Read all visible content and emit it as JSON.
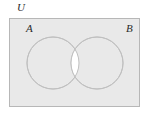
{
  "figure": {
    "name": "venn-diagram-two-sets-symmetric-difference",
    "type": "venn",
    "canvas": {
      "width": 150,
      "height": 118,
      "background": "#ffffff"
    },
    "universe": {
      "label": "U",
      "shape": "rectangle",
      "x": 9,
      "y": 18,
      "width": 131,
      "height": 89,
      "fill": "#e9e9e9",
      "stroke": "#b7b7b7",
      "stroke_width": 1
    },
    "sets": [
      {
        "id": "A",
        "label": "A",
        "cx": 53,
        "cy": 63,
        "r": 26,
        "fill": "#e9e9e9",
        "stroke": "#c0c0c0",
        "stroke_width": 1,
        "label_x": 26,
        "label_y": 23
      },
      {
        "id": "B",
        "label": "B",
        "cx": 97,
        "cy": 63,
        "r": 26,
        "fill": "#e9e9e9",
        "stroke": "#c0c0c0",
        "stroke_width": 1,
        "label_x": 126,
        "label_y": 23
      }
    ],
    "intersection": {
      "name": "A-intersect-B",
      "fill": "#ffffff",
      "stroke": "#c0c0c0",
      "shaded": false
    },
    "shading_note": "intersection region is unshaded (white); universe and both set regions are shaded light grey"
  }
}
